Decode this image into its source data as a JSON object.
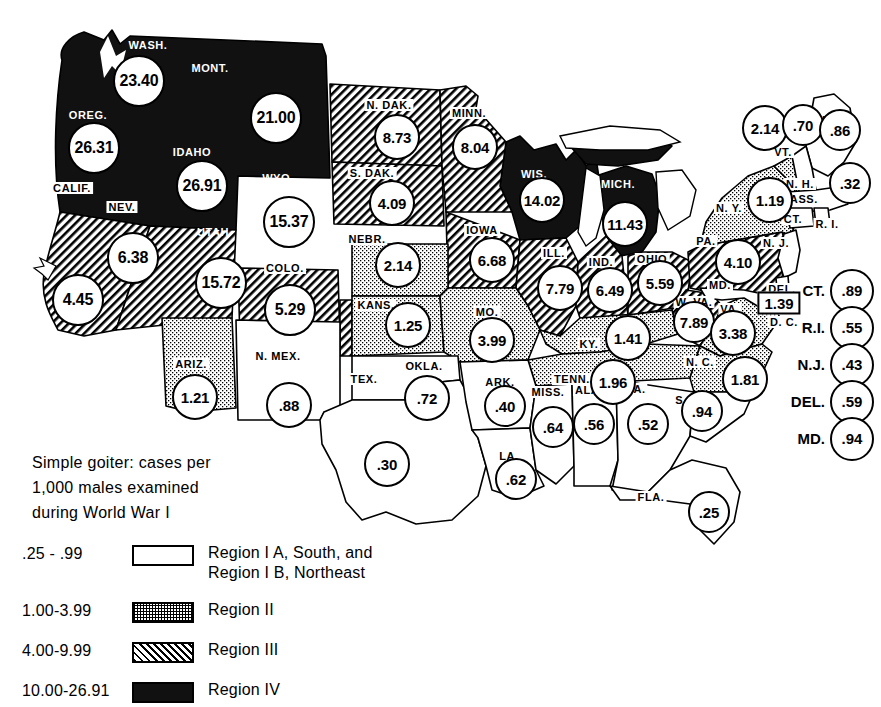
{
  "caption": {
    "line1": "Simple goiter: cases per",
    "line2": "1,000 males examined",
    "line3": "during World War I"
  },
  "legend": {
    "rows": [
      {
        "range": ".25 - .99",
        "swatch": "outline-white",
        "label_line1": "Region I A, South, and",
        "label_line2": "Region I B, Northeast"
      },
      {
        "range": "1.00-3.99",
        "swatch": "stipple",
        "label_line1": "Region II",
        "label_line2": ""
      },
      {
        "range": "4.00-9.99",
        "swatch": "hatch",
        "label_line1": "Region III",
        "label_line2": ""
      },
      {
        "range": "10.00-26.91",
        "swatch": "solid",
        "label_line1": "Region IV",
        "label_line2": ""
      }
    ]
  },
  "states": [
    {
      "abbr": "WASH.",
      "value": "23.40",
      "region": 4,
      "lx": 148,
      "ly": 45,
      "bx": 139,
      "by": 81,
      "size": "w48",
      "dark": true
    },
    {
      "abbr": "MONT.",
      "value": "21.00",
      "region": 4,
      "lx": 210,
      "ly": 68,
      "bx": 276,
      "by": 118,
      "size": "w48",
      "dark": true
    },
    {
      "abbr": "OREG.",
      "value": "26.31",
      "region": 4,
      "lx": 88,
      "ly": 115,
      "bx": 94,
      "by": 148,
      "size": "w48",
      "dark": true
    },
    {
      "abbr": "IDAHO",
      "value": "26.91",
      "region": 4,
      "lx": 192,
      "ly": 152,
      "bx": 202,
      "by": 186,
      "size": "w48",
      "dark": true
    },
    {
      "abbr": "WYO.",
      "value": "15.37",
      "region": 4,
      "lx": 278,
      "ly": 178,
      "bx": 289,
      "by": 222,
      "size": "w48",
      "dark": true
    },
    {
      "abbr": "UTAH",
      "value": "15.72",
      "region": 4,
      "lx": 213,
      "ly": 232,
      "bx": 221,
      "by": 283,
      "size": "w48",
      "dark": true
    },
    {
      "abbr": "COLO.",
      "value": "5.29",
      "region": 3,
      "lx": 285,
      "ly": 268,
      "bx": 290,
      "by": 310,
      "size": "w48",
      "dark": false
    },
    {
      "abbr": "CALIF.",
      "value": "4.45",
      "region": 3,
      "lx": 72,
      "ly": 188,
      "bx": 78,
      "by": 300,
      "size": "w48",
      "dark": false
    },
    {
      "abbr": "NEV.",
      "value": "6.38",
      "region": 3,
      "lx": 122,
      "ly": 207,
      "bx": 133,
      "by": 258,
      "size": "w48",
      "dark": false
    },
    {
      "abbr": "ARIZ.",
      "value": "1.21",
      "region": 2,
      "lx": 191,
      "ly": 364,
      "bx": 195,
      "by": 397,
      "size": "w42",
      "dark": false
    },
    {
      "abbr": "N. MEX.",
      "value": ".88",
      "region": 1,
      "lx": 278,
      "ly": 356,
      "bx": 289,
      "by": 405,
      "size": "w42",
      "dark": false
    },
    {
      "abbr": "TEX.",
      "value": ".30",
      "region": 1,
      "lx": 364,
      "ly": 379,
      "bx": 387,
      "by": 464,
      "size": "w42",
      "dark": false
    },
    {
      "abbr": "OKLA.",
      "value": ".72",
      "region": 1,
      "lx": 424,
      "ly": 366,
      "bx": 427,
      "by": 398,
      "size": "w42",
      "dark": false
    },
    {
      "abbr": "KANS.",
      "value": "1.25",
      "region": 2,
      "lx": 376,
      "ly": 305,
      "bx": 408,
      "by": 325,
      "size": "w42",
      "dark": false
    },
    {
      "abbr": "NEBR.",
      "value": "2.14",
      "region": 2,
      "lx": 367,
      "ly": 239,
      "bx": 398,
      "by": 265,
      "size": "w42",
      "dark": false
    },
    {
      "abbr": "N. DAK.",
      "value": "8.73",
      "region": 3,
      "lx": 389,
      "ly": 105,
      "bx": 397,
      "by": 137,
      "size": "w42",
      "dark": false
    },
    {
      "abbr": "S. DAK.",
      "value": "4.09",
      "region": 3,
      "lx": 372,
      "ly": 173,
      "bx": 392,
      "by": 203,
      "size": "w42",
      "dark": false
    },
    {
      "abbr": "MINN.",
      "value": "8.04",
      "region": 3,
      "lx": 469,
      "ly": 113,
      "bx": 475,
      "by": 147,
      "size": "w42",
      "dark": false
    },
    {
      "abbr": "IOWA",
      "value": "6.68",
      "region": 3,
      "lx": 482,
      "ly": 230,
      "bx": 492,
      "by": 260,
      "size": "w42",
      "dark": false
    },
    {
      "abbr": "MO.",
      "value": "3.99",
      "region": 2,
      "lx": 487,
      "ly": 312,
      "bx": 492,
      "by": 340,
      "size": "w42",
      "dark": false
    },
    {
      "abbr": "ARK.",
      "value": ".40",
      "region": 1,
      "lx": 500,
      "ly": 382,
      "bx": 505,
      "by": 406,
      "size": "w38",
      "dark": false
    },
    {
      "abbr": "LA.",
      "value": ".62",
      "region": 1,
      "lx": 509,
      "ly": 456,
      "bx": 516,
      "by": 479,
      "size": "w38",
      "dark": false
    },
    {
      "abbr": "MISS.",
      "value": ".64",
      "region": 1,
      "lx": 548,
      "ly": 392,
      "bx": 553,
      "by": 427,
      "size": "w38",
      "dark": false
    },
    {
      "abbr": "ALA.",
      "value": ".56",
      "region": 1,
      "lx": 589,
      "ly": 390,
      "bx": 594,
      "by": 424,
      "size": "w38",
      "dark": false
    },
    {
      "abbr": "GA.",
      "value": ".52",
      "region": 1,
      "lx": 635,
      "ly": 389,
      "bx": 648,
      "by": 424,
      "size": "w38",
      "dark": false
    },
    {
      "abbr": "S. C.",
      "value": ".94",
      "region": 1,
      "lx": 689,
      "ly": 400,
      "bx": 702,
      "by": 411,
      "size": "w38",
      "dark": false
    },
    {
      "abbr": "FLA.",
      "value": ".25",
      "region": 1,
      "lx": 651,
      "ly": 497,
      "bx": 709,
      "by": 512,
      "size": "w38",
      "dark": false
    },
    {
      "abbr": "TENN.",
      "value": "1.96",
      "region": 2,
      "lx": 572,
      "ly": 379,
      "bx": 613,
      "by": 382,
      "size": "w42",
      "dark": false
    },
    {
      "abbr": "KY.",
      "value": "1.41",
      "region": 2,
      "lx": 589,
      "ly": 344,
      "bx": 628,
      "by": 338,
      "size": "w42",
      "dark": false
    },
    {
      "abbr": "N. C.",
      "value": "1.81",
      "region": 2,
      "lx": 700,
      "ly": 362,
      "bx": 745,
      "by": 379,
      "size": "w42",
      "dark": false
    },
    {
      "abbr": "ILL.",
      "value": "7.79",
      "region": 3,
      "lx": 554,
      "ly": 253,
      "bx": 560,
      "by": 288,
      "size": "w42",
      "dark": false
    },
    {
      "abbr": "IND.",
      "value": "6.49",
      "region": 3,
      "lx": 601,
      "ly": 262,
      "bx": 610,
      "by": 290,
      "size": "w42",
      "dark": false
    },
    {
      "abbr": "OHIO",
      "value": "5.59",
      "region": 3,
      "lx": 652,
      "ly": 259,
      "bx": 660,
      "by": 283,
      "size": "w42",
      "dark": false
    },
    {
      "abbr": "WIS.",
      "value": "14.02",
      "region": 4,
      "lx": 534,
      "ly": 174,
      "bx": 542,
      "by": 200,
      "size": "w42",
      "dark": true
    },
    {
      "abbr": "MICH.",
      "value": "11.43",
      "region": 4,
      "lx": 618,
      "ly": 184,
      "bx": 625,
      "by": 224,
      "size": "w42",
      "dark": true
    },
    {
      "abbr": "W. VA.",
      "value": "7.89",
      "region": 3,
      "lx": 694,
      "ly": 302,
      "bx": 694,
      "by": 322,
      "size": "w38",
      "dark": false
    },
    {
      "abbr": "VA.",
      "value": "3.38",
      "region": 2,
      "lx": 730,
      "ly": 309,
      "bx": 733,
      "by": 333,
      "size": "w42",
      "dark": false
    },
    {
      "abbr": "PA.",
      "value": "4.10",
      "region": 3,
      "lx": 706,
      "ly": 241,
      "bx": 738,
      "by": 262,
      "size": "w42",
      "dark": false
    },
    {
      "abbr": "N. Y.",
      "value": "1.19",
      "region": 2,
      "lx": 729,
      "ly": 208,
      "bx": 770,
      "by": 200,
      "size": "w42",
      "dark": false
    },
    {
      "abbr": "VT.",
      "value": "2.14",
      "region": 2,
      "lx": 783,
      "ly": 152,
      "bx": 765,
      "by": 128,
      "size": "w42",
      "dark": false
    },
    {
      "abbr": "N. H.",
      "value": ".70",
      "region": 1,
      "lx": 800,
      "ly": 184,
      "bx": 803,
      "by": 125,
      "size": "w38",
      "dark": false
    },
    {
      "abbr": "MAINE",
      "value": ".86",
      "region": 1,
      "lx": 836,
      "ly": 120,
      "bx": 840,
      "by": 130,
      "size": "w38",
      "dark": false
    },
    {
      "abbr": "MASS.",
      "value": ".32",
      "region": 1,
      "lx": 799,
      "ly": 199,
      "bx": 850,
      "by": 183,
      "size": "w38",
      "dark": false
    }
  ],
  "map_only_labels": [
    {
      "abbr": "CT.",
      "lx": 793,
      "ly": 219
    },
    {
      "abbr": "R. I.",
      "lx": 827,
      "ly": 224
    },
    {
      "abbr": "N. J.",
      "lx": 776,
      "ly": 243
    },
    {
      "abbr": "DEL.",
      "lx": 782,
      "ly": 289
    },
    {
      "abbr": "MD.",
      "lx": 720,
      "ly": 285
    },
    {
      "abbr": "D. C.",
      "lx": 784,
      "ly": 322
    }
  ],
  "dc": {
    "label": "D. C.",
    "value": "1.39",
    "bx": 779,
    "by": 303
  },
  "side_list": [
    {
      "name": "CT.",
      "value": ".89"
    },
    {
      "name": "R.I.",
      "value": ".55"
    },
    {
      "name": "N.J.",
      "value": ".43"
    },
    {
      "name": "DEL.",
      "value": ".59"
    },
    {
      "name": "MD.",
      "value": ".94"
    }
  ],
  "chart_data": {
    "type": "map",
    "title": "Simple goiter: cases per 1,000 males examined during World War I",
    "unit": "cases per 1,000 males examined",
    "regions": [
      {
        "id": "I",
        "range": ".25 - .99",
        "min": 0.25,
        "max": 0.99,
        "fill": "white",
        "name": "Region I A, South, and Region I B, Northeast"
      },
      {
        "id": "II",
        "range": "1.00-3.99",
        "min": 1.0,
        "max": 3.99,
        "fill": "stipple",
        "name": "Region II"
      },
      {
        "id": "III",
        "range": "4.00-9.99",
        "min": 4.0,
        "max": 9.99,
        "fill": "hatch",
        "name": "Region III"
      },
      {
        "id": "IV",
        "range": "10.00-26.91",
        "min": 10.0,
        "max": 26.91,
        "fill": "solid",
        "name": "Region IV"
      }
    ],
    "values": {
      "WASH.": 23.4,
      "OREG.": 26.31,
      "IDAHO": 26.91,
      "MONT.": 21.0,
      "WYO.": 15.37,
      "UTAH": 15.72,
      "NEV.": 6.38,
      "CALIF.": 4.45,
      "ARIZ.": 1.21,
      "N. MEX.": 0.88,
      "COLO.": 5.29,
      "N. DAK.": 8.73,
      "S. DAK.": 4.09,
      "NEBR.": 2.14,
      "KANS.": 1.25,
      "OKLA.": 0.72,
      "TEX.": 0.3,
      "MINN.": 8.04,
      "IOWA": 6.68,
      "MO.": 3.99,
      "ARK.": 0.4,
      "LA.": 0.62,
      "WIS.": 14.02,
      "ILL.": 7.79,
      "MICH.": 11.43,
      "IND.": 6.49,
      "OHIO": 5.59,
      "KY.": 1.41,
      "TENN.": 1.96,
      "MISS.": 0.64,
      "ALA.": 0.56,
      "GA.": 0.52,
      "FLA.": 0.25,
      "S. C.": 0.94,
      "N. C.": 1.81,
      "VA.": 3.38,
      "W. VA.": 7.89,
      "PA.": 4.1,
      "N. Y.": 1.19,
      "VT.": 2.14,
      "N. H.": 0.7,
      "MAINE": 0.86,
      "MASS.": 0.32,
      "CT.": 0.89,
      "R.I.": 0.55,
      "N.J.": 0.43,
      "DEL.": 0.59,
      "MD.": 0.94,
      "D. C.": 1.39
    },
    "min_value": 0.25,
    "max_value": 26.91
  }
}
